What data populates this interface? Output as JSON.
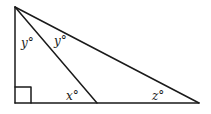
{
  "diagram": {
    "type": "geometry-triangle",
    "colors": {
      "stroke": "#1a1a1a",
      "background": "#ffffff"
    },
    "vertices": {
      "top": [
        15,
        7
      ],
      "bottom_left": [
        15,
        103
      ],
      "cevian_foot": [
        97,
        103
      ],
      "bottom_right": [
        199,
        103
      ]
    },
    "right_angle_marker": {
      "at": "bottom_left",
      "size": 16
    },
    "labels": [
      {
        "id": "angle-y-left",
        "text": "y°",
        "x": 21,
        "y": 47
      },
      {
        "id": "angle-y-right",
        "text": "y°",
        "x": 54,
        "y": 45
      },
      {
        "id": "angle-x",
        "text": "x°",
        "x": 66,
        "y": 100
      },
      {
        "id": "angle-z",
        "text": "z°",
        "x": 152,
        "y": 100
      }
    ]
  }
}
